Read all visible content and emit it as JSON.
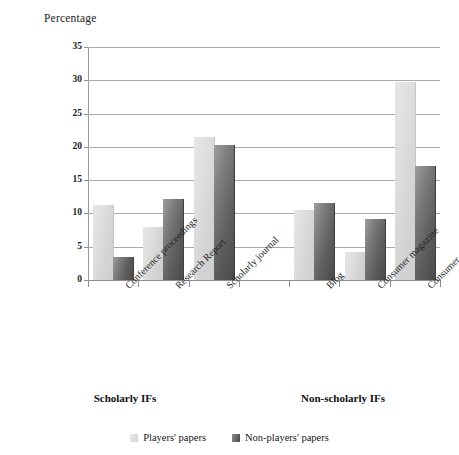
{
  "chart_data": {
    "type": "bar",
    "title": "",
    "ylabel": "Percentage",
    "xlabel": "",
    "ylim": [
      0,
      35
    ],
    "ytick_values": [
      0,
      5,
      10,
      15,
      20,
      25,
      30,
      35
    ],
    "ytick_labels": [
      "0",
      "5",
      "10",
      "15",
      "20",
      "25",
      "30",
      "35"
    ],
    "grid": true,
    "legend_position": "bottom",
    "categories": [
      "Conference proceedings",
      "Research Report",
      "Scholarly journal",
      "Blog",
      "Consumer magazine",
      "Consumer newspaper"
    ],
    "groups": [
      {
        "label": "Scholarly IFs",
        "categories": [
          "Conference proceedings",
          "Research Report",
          "Scholarly journal"
        ]
      },
      {
        "label": "Non-scholarly IFs",
        "categories": [
          "Blog",
          "Consumer magazine",
          "Consumer newspaper"
        ]
      }
    ],
    "series": [
      {
        "name": "Players' papers",
        "color": "#d8d8d8",
        "values": [
          11.2,
          8.0,
          21.5,
          10.5,
          4.2,
          29.8
        ]
      },
      {
        "name": "Non-players' papers",
        "color": "#5a5a5a",
        "values": [
          3.4,
          12.2,
          20.3,
          11.6,
          9.1,
          17.2
        ]
      }
    ]
  },
  "axis": {
    "y_title": "Percentage"
  },
  "groups": {
    "scholarly": "Scholarly IFs",
    "non_scholarly": "Non-scholarly IFs"
  },
  "categories": {
    "c0": "Conference proceedings",
    "c1": "Research Report",
    "c2": "Scholarly journal",
    "c3": "Blog",
    "c4": "Consumer magazine",
    "c5": "Consumer newspaper"
  },
  "legend": {
    "items": [
      {
        "label": "Players' papers",
        "swatch": "light-gray-square"
      },
      {
        "label": "Non-players' papers",
        "swatch": "dark-gray-square"
      }
    ]
  },
  "yticks": {
    "t0": "0",
    "t1": "5",
    "t2": "10",
    "t3": "15",
    "t4": "20",
    "t5": "25",
    "t6": "30",
    "t7": "35"
  }
}
